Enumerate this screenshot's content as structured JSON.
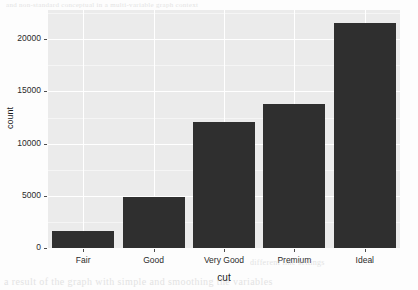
{
  "chart_data": {
    "type": "bar",
    "title": "",
    "subtitle": "",
    "xlabel": "cut",
    "ylabel": "count",
    "categories": [
      "Fair",
      "Good",
      "Very Good",
      "Premium",
      "Ideal"
    ],
    "values": [
      1610,
      4906,
      12082,
      13791,
      21551
    ],
    "ylim": [
      0,
      22800
    ],
    "ytick_values": [
      0,
      5000,
      10000,
      15000,
      20000
    ],
    "ytick_labels": [
      "0",
      "5000",
      "10000",
      "15000",
      "20000"
    ],
    "grid": true,
    "legend": "none",
    "bar_color": "#2f2f2f",
    "panel_color": "#ebebeb",
    "gridline_color": "#ffffff"
  },
  "artifacts": {
    "top_text": "and non-standard conceptual in a multi-variable graph context",
    "bottom_text": "a result of the graph with simple and smoothing the variables",
    "mid_text": "different line settings"
  }
}
